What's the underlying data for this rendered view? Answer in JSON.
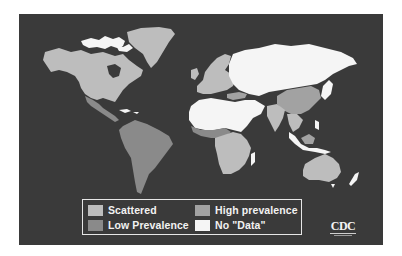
{
  "map": {
    "title": "",
    "background_color": "#3a3a3a",
    "categories": {
      "scattered": {
        "label": "Scattered",
        "color": "#bdbdbd"
      },
      "low_prevalence": {
        "label": "Low Prevalence",
        "color": "#8a8a8a"
      },
      "high_prevalence": {
        "label": "High prevalence",
        "color": "#a2a2a2"
      },
      "no_data": {
        "label": "No \"Data\"",
        "color": "#f5f5f5"
      }
    },
    "regions": [
      {
        "name": "North America (Canada, USA)",
        "category": "scattered"
      },
      {
        "name": "Greenland",
        "category": "scattered"
      },
      {
        "name": "Arctic islands",
        "category": "no_data"
      },
      {
        "name": "Mexico / Central America",
        "category": "low_prevalence"
      },
      {
        "name": "South America",
        "category": "low_prevalence"
      },
      {
        "name": "Europe",
        "category": "scattered"
      },
      {
        "name": "Turkey",
        "category": "high_prevalence"
      },
      {
        "name": "Russia / Central Asia",
        "category": "no_data"
      },
      {
        "name": "North Africa / Middle East",
        "category": "no_data"
      },
      {
        "name": "West Africa (Sahel)",
        "category": "low_prevalence"
      },
      {
        "name": "Central & Southern Africa",
        "category": "scattered"
      },
      {
        "name": "Madagascar",
        "category": "no_data"
      },
      {
        "name": "China",
        "category": "high_prevalence"
      },
      {
        "name": "India / South Asia",
        "category": "scattered"
      },
      {
        "name": "Southeast Asia",
        "category": "scattered"
      },
      {
        "name": "Indonesia (Borneo)",
        "category": "high_prevalence"
      },
      {
        "name": "Japan / Korea",
        "category": "no_data"
      },
      {
        "name": "Australia",
        "category": "scattered"
      },
      {
        "name": "New Zealand",
        "category": "no_data"
      }
    ]
  },
  "legend": {
    "items": [
      {
        "label": "Scattered",
        "color": "#bdbdbd"
      },
      {
        "label": "Low Prevalence",
        "color": "#8a8a8a"
      },
      {
        "label": "High prevalence",
        "color": "#a2a2a2"
      },
      {
        "label": "No \"Data\"",
        "color": "#f5f5f5"
      }
    ]
  },
  "logo": {
    "text": "CDC"
  }
}
